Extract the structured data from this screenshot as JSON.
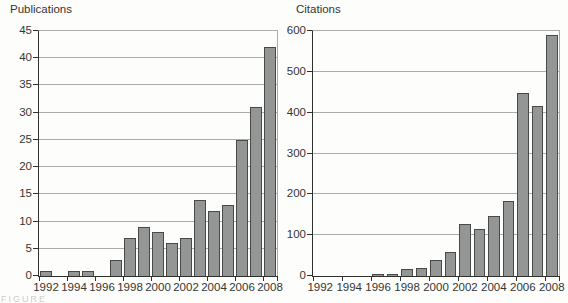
{
  "caption_fragment": "FIGURE",
  "colors": {
    "background": "#fdfdfb",
    "bar_fill": "#939695",
    "bar_border": "#474a49",
    "gridline": "#aaacaa",
    "axis": "#2f312f",
    "text": "#333533"
  },
  "chart_data": [
    {
      "type": "bar",
      "title": "Publications",
      "categories": [
        "1992",
        "1993",
        "1994",
        "1995",
        "1996",
        "1997",
        "1998",
        "1999",
        "2000",
        "2001",
        "2002",
        "2003",
        "2004",
        "2005",
        "2006",
        "2007",
        "2008"
      ],
      "values": [
        1,
        0,
        1,
        1,
        0,
        3,
        7,
        9,
        8,
        6,
        7,
        14,
        12,
        13,
        25,
        31,
        42
      ],
      "xlabel": "",
      "ylabel": "Publications",
      "ylim": [
        0,
        45
      ],
      "yticks": [
        45,
        40,
        35,
        30,
        25,
        20,
        15,
        10,
        5,
        0
      ],
      "xtick_labels": [
        "1992",
        "1994",
        "1996",
        "1998",
        "2000",
        "2002",
        "2004",
        "2006",
        "2008"
      ],
      "grid": "horizontal",
      "legend": "none"
    },
    {
      "type": "bar",
      "title": "Citations",
      "categories": [
        "1992",
        "1993",
        "1994",
        "1995",
        "1996",
        "1997",
        "1998",
        "1999",
        "2000",
        "2001",
        "2002",
        "2003",
        "2004",
        "2005",
        "2006",
        "2007",
        "2008"
      ],
      "values": [
        0,
        0,
        0,
        0,
        4,
        5,
        18,
        20,
        40,
        60,
        128,
        115,
        148,
        183,
        448,
        417,
        590
      ],
      "xlabel": "",
      "ylabel": "Citations",
      "ylim": [
        0,
        600
      ],
      "yticks": [
        600,
        500,
        400,
        300,
        200,
        100,
        0
      ],
      "xtick_labels": [
        "1992",
        "1994",
        "1996",
        "1998",
        "2000",
        "2002",
        "2004",
        "2006",
        "2008"
      ],
      "grid": "horizontal",
      "legend": "none"
    }
  ]
}
